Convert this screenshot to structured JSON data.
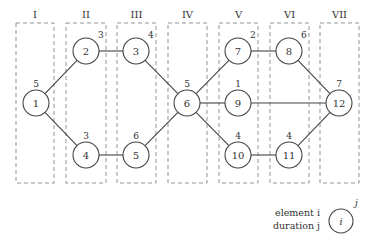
{
  "stages": [
    {
      "label": "I",
      "x": 16,
      "w": 38
    },
    {
      "label": "II",
      "x": 66,
      "w": 40
    },
    {
      "label": "III",
      "x": 117,
      "w": 39
    },
    {
      "label": "IV",
      "x": 168,
      "w": 39
    },
    {
      "label": "V",
      "x": 219,
      "w": 39
    },
    {
      "label": "VI",
      "x": 270,
      "w": 39
    },
    {
      "label": "VII",
      "x": 320,
      "w": 39
    }
  ],
  "stage_box": {
    "y": 23,
    "h": 160,
    "label_y": 18
  },
  "node_radius": 13,
  "nodes": [
    {
      "id": "1",
      "x": 36,
      "y": 103,
      "duration": "5"
    },
    {
      "id": "2",
      "x": 86,
      "y": 51,
      "duration": "3"
    },
    {
      "id": "3",
      "x": 136,
      "y": 51,
      "duration": "4"
    },
    {
      "id": "4",
      "x": 86,
      "y": 155,
      "duration": "3"
    },
    {
      "id": "5",
      "x": 136,
      "y": 155,
      "duration": "6"
    },
    {
      "id": "6",
      "x": 187,
      "y": 103,
      "duration": "5"
    },
    {
      "id": "7",
      "x": 238,
      "y": 51,
      "duration": "2"
    },
    {
      "id": "8",
      "x": 289,
      "y": 51,
      "duration": "6"
    },
    {
      "id": "9",
      "x": 238,
      "y": 103,
      "duration": "1"
    },
    {
      "id": "10",
      "x": 238,
      "y": 155,
      "duration": "4"
    },
    {
      "id": "11",
      "x": 289,
      "y": 155,
      "duration": "4"
    },
    {
      "id": "12",
      "x": 339,
      "y": 103,
      "duration": "7"
    }
  ],
  "edges": [
    [
      "1",
      "2"
    ],
    [
      "2",
      "3"
    ],
    [
      "3",
      "6"
    ],
    [
      "1",
      "4"
    ],
    [
      "4",
      "5"
    ],
    [
      "5",
      "6"
    ],
    [
      "6",
      "7"
    ],
    [
      "7",
      "8"
    ],
    [
      "8",
      "12"
    ],
    [
      "6",
      "9"
    ],
    [
      "9",
      "12"
    ],
    [
      "6",
      "10"
    ],
    [
      "10",
      "11"
    ],
    [
      "11",
      "12"
    ]
  ],
  "legend": {
    "element_label": "element i",
    "duration_label": "duration j",
    "node_symbol": "i",
    "duration_symbol": "j"
  }
}
